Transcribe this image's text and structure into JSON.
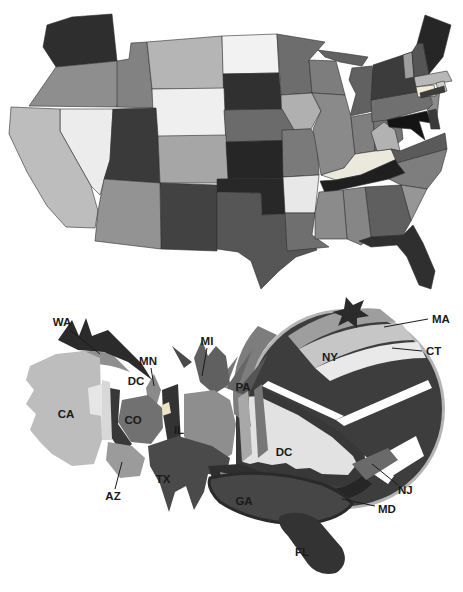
{
  "figure": {
    "background": "#ffffff"
  },
  "choropleth": {
    "states": {
      "WA": "#2e2e2e",
      "OR": "#8e8e8e",
      "CA": "#bdbdbd",
      "ID": "#828282",
      "NV": "#ececec",
      "MT": "#b5b5b5",
      "WY": "#efefef",
      "UT": "#3a3a3a",
      "CO": "#a6a6a6",
      "AZ": "#939393",
      "NM": "#424242",
      "ND": "#f2f2f2",
      "SD": "#303030",
      "NE": "#6b6b6b",
      "KS": "#262626",
      "OK": "#282828",
      "TX": "#565656",
      "MN": "#6d6d6d",
      "IA": "#b0b0b0",
      "MO": "#7a7a7a",
      "AR": "#e8e8e8",
      "LA": "#6f6f6f",
      "WI": "#7d7d7d",
      "IL": "#8a8a8a",
      "MI_UP": "#616161",
      "MI": "#616161",
      "IN": "#7f7f7f",
      "OH": "#757575",
      "KY": "#ebe8dc",
      "TN": "#1f1f1f",
      "MS": "#8b8b8b",
      "AL": "#868686",
      "GA": "#5f5f5f",
      "FL": "#2f2f2f",
      "SC": "#969696",
      "NC": "#7e7e7e",
      "VA": "#5a5a5a",
      "WV": "#b2b2b2",
      "MD": "#141414",
      "DE": "#3a3a3a",
      "PA": "#707070",
      "NJ": "#8c8c8c",
      "NY": "#3c3c3c",
      "LI": "#3c3c3c",
      "VT": "#9e9e9e",
      "NH": "#555555",
      "ME": "#262626",
      "MA": "#b8b8b8",
      "RI": "#cfcfcf",
      "CT": "#f2ecd6"
    },
    "border_color": "#2f2f2f"
  },
  "cartogram": {
    "regions": {
      "rim": "#b4b4b4",
      "ny": "#3d3d3d",
      "ma_band": "#9e9e9e",
      "ct_band": "#c6c6c6",
      "pale_wedge": "#e9e9e9",
      "star": "#2b2b2b",
      "white_gap": "#ffffff",
      "dc_ring": "#383838",
      "step_band": "#9a9a9a",
      "dc": "#e2e2e2",
      "md": "#262626",
      "nj": "#6a6a6a",
      "pa": "#7d7d7d",
      "dark_left": "#383838",
      "dark_mid": "#333333",
      "spike_1": "#555555",
      "spike_2": "#666666",
      "spike_3": "#777777",
      "mi": "#606060",
      "mi_spike": "#4a4a4a",
      "mn": "#8a8a8a",
      "dc_small": "#eee2c4",
      "co": "#717171",
      "il": "#8e8e8e",
      "sliver_1": "#a8a8a8",
      "sliver_2": "#777777",
      "tx": "#4a4a4a",
      "tx_band": "#2f2f2f",
      "ga_strip": "#8a8a8a",
      "ga": "#464646",
      "ga_edge": "#2a2a2a",
      "fl": "#333333",
      "ca": "#bdbdbd",
      "ca_patch": "#e6e6e6",
      "ca_strip": "#d8d8d8",
      "or_band": "#8f8f8f",
      "wa": "#2b2b2b",
      "az": "#9b9b9b"
    },
    "labels": {
      "wa": "WA",
      "ma": "MA",
      "ct": "CT",
      "mi": "MI",
      "mn": "MN",
      "dc_small": "DC",
      "pa": "PA",
      "ny": "NY",
      "ca": "CA",
      "co": "CO",
      "il": "IL",
      "dc_center": "DC",
      "tx": "TX",
      "az": "AZ",
      "ga": "GA",
      "nj": "NJ",
      "md": "MD",
      "fl": "FL"
    },
    "label_color": "#1a1a1a",
    "line_color": "#1a1a1a"
  }
}
